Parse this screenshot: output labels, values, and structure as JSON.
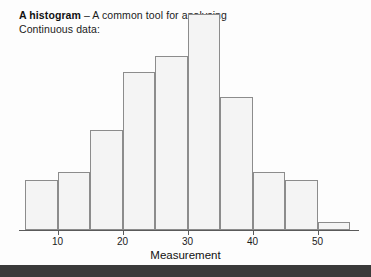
{
  "caption": {
    "lead": "A histogram",
    "rest": " – A common tool for analysing Continuous data:"
  },
  "chart_data": {
    "type": "bar",
    "title": "",
    "xlabel": "Measurement",
    "ylabel": "",
    "grid": false,
    "legend": "none",
    "xlim": [
      5,
      57
    ],
    "ylim": [
      0,
      26
    ],
    "bin_width": 5,
    "bin_edges": [
      5,
      10,
      15,
      20,
      25,
      30,
      35,
      40,
      45,
      50,
      55
    ],
    "categories": [
      "5-10",
      "10-15",
      "15-20",
      "20-25",
      "25-30",
      "30-35",
      "35-40",
      "40-45",
      "45-50",
      "50-55"
    ],
    "values": [
      6,
      7,
      12,
      19,
      21,
      26,
      16,
      7,
      6,
      1
    ],
    "tick_labels": [
      "10",
      "20",
      "30",
      "40",
      "50"
    ],
    "tick_values": [
      10,
      20,
      30,
      40,
      50
    ],
    "bar_fill": "#f4f4f4",
    "bar_stroke": "#8c8c8c",
    "axis_color": "#5a5a5a"
  },
  "colors": {
    "background": "#fdfdfd",
    "bottom_band": "#3a3a3a",
    "text": "#1b1b1b"
  }
}
